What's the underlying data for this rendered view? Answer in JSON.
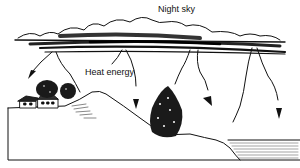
{
  "diagram": {
    "labels": {
      "sky": "Night sky",
      "heat": "Heat energy"
    },
    "colors": {
      "ink": "#111111",
      "background": "#ffffff"
    }
  }
}
